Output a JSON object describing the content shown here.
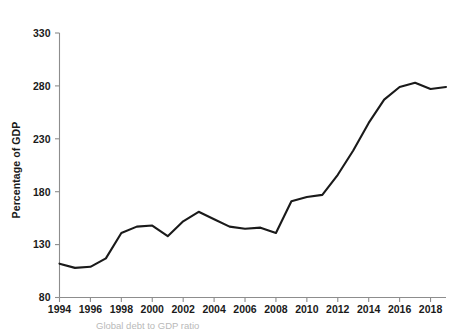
{
  "figure": {
    "background": "#ffffff",
    "line_color": "#1a1a1a",
    "axis_color": "#8d8d8d",
    "text_color": "#1a1a1a",
    "caption_color": "#b9b9b9",
    "caption": "Global debt to GDP ratio",
    "top_clipped_text": ""
  },
  "chart_data": {
    "type": "line",
    "title": "",
    "subtitle": "",
    "xlabel": "",
    "ylabel": "Percentage of GDP",
    "xlim": [
      1994,
      2019
    ],
    "ylim": [
      80,
      330
    ],
    "yticks": [
      80,
      130,
      180,
      230,
      280,
      330
    ],
    "ytick_labels": [
      "80",
      "130",
      "180",
      "230",
      "280",
      "330"
    ],
    "xticks": [
      1994,
      1996,
      1998,
      2000,
      2002,
      2004,
      2006,
      2008,
      2010,
      2012,
      2014,
      2016,
      2018
    ],
    "xtick_labels": [
      "1994",
      "1996",
      "1998",
      "2000",
      "2002",
      "2004",
      "2006",
      "2008",
      "2010",
      "2012",
      "2014",
      "2016",
      "2018"
    ],
    "grid": false,
    "legend": false,
    "legend_position": "none",
    "x": [
      1994,
      1995,
      1996,
      1997,
      1998,
      1999,
      2000,
      2001,
      2002,
      2003,
      2004,
      2005,
      2006,
      2007,
      2008,
      2009,
      2010,
      2011,
      2012,
      2013,
      2014,
      2015,
      2016,
      2017,
      2018,
      2019
    ],
    "series": [
      {
        "name": "Global debt to GDP ratio",
        "color": "#1a1a1a",
        "values": [
          112,
          108,
          109,
          117,
          141,
          147,
          148,
          138,
          152,
          161,
          154,
          147,
          145,
          146,
          141,
          171,
          175,
          177,
          196,
          219,
          245,
          267,
          279,
          283,
          277,
          279
        ]
      }
    ]
  }
}
